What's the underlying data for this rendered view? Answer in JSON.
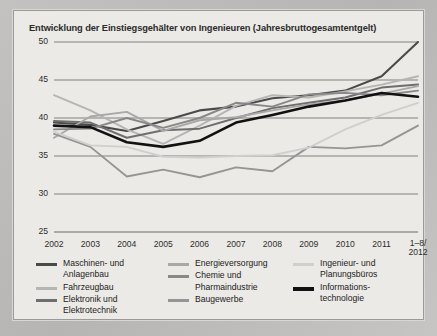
{
  "panel": {
    "background_color": "#eceae6",
    "frame_color": "#9b9a98"
  },
  "header": {
    "title": "Entwicklung der Einstiegsgehälter von Ingenieuren (Jahresbruttogesamtentgelt)"
  },
  "legend": {
    "columns": [
      {
        "items": [
          {
            "label": "Maschinen- und\nAnlagenbau",
            "color": "#4a4a4a",
            "width": 3.4
          },
          {
            "label": "Fahrzeugbau",
            "color": "#b5b5b5",
            "width": 3.0
          },
          {
            "label": "Elektronik und\nElektrotechnik",
            "color": "#6e6e6e",
            "width": 3.2
          }
        ]
      },
      {
        "items": [
          {
            "label": "Energieversorgung",
            "color": "#a8a8a8",
            "width": 3.0
          },
          {
            "label": "Chemie und\nPharmaindustrie",
            "color": "#888888",
            "width": 3.0
          },
          {
            "label": "Baugewerbe",
            "color": "#959595",
            "width": 3.0
          }
        ]
      },
      {
        "items": [
          {
            "label": "Ingenieur- und\nPlanungsbüros",
            "color": "#cfcfcf",
            "width": 3.0
          },
          {
            "label": "Informations-\ntechnologie",
            "color": "#111111",
            "width": 4.2
          }
        ]
      }
    ]
  },
  "chart_data": {
    "type": "line",
    "title": "Entwicklung der Einstiegsgehälter von Ingenieuren (Jahresbruttogesamtentgelt)",
    "xlabel": "",
    "ylabel": "",
    "ylim": [
      25,
      50
    ],
    "yticks": [
      25,
      30,
      35,
      40,
      45,
      50
    ],
    "grid": true,
    "legend_position": "bottom",
    "x": [
      "2002",
      "2003",
      "2004",
      "2005",
      "2006",
      "2007",
      "2008",
      "2009",
      "2010",
      "2011",
      "1-8/\n2012"
    ],
    "xtick_labels": [
      "2002",
      "2003",
      "2004",
      "2005",
      "2006",
      "2007",
      "2008",
      "2009",
      "2010",
      "2011",
      "1–8/\n2012"
    ],
    "series": [
      {
        "name": "Maschinen- und Anlagenbau",
        "color": "#4a4a4a",
        "width": 2.1,
        "values": [
          39.4,
          39.1,
          38.3,
          39.6,
          41.0,
          41.5,
          42.6,
          43.0,
          43.6,
          45.5,
          50.0
        ]
      },
      {
        "name": "Fahrzeugbau",
        "color": "#b5b5b5",
        "width": 1.9,
        "values": [
          43.0,
          41.0,
          38.5,
          36.6,
          39.0,
          41.6,
          43.0,
          42.7,
          43.5,
          44.4,
          45.5
        ]
      },
      {
        "name": "Elektronik und Elektrotechnik",
        "color": "#6e6e6e",
        "width": 2.0,
        "values": [
          39.6,
          39.4,
          37.4,
          38.4,
          38.6,
          40.0,
          41.3,
          42.0,
          42.7,
          44.0,
          44.4
        ]
      },
      {
        "name": "Energieversorgung",
        "color": "#a8a8a8",
        "width": 1.9,
        "values": [
          37.4,
          40.2,
          40.8,
          38.3,
          39.7,
          40.1,
          41.0,
          41.8,
          42.3,
          43.2,
          44.2
        ]
      },
      {
        "name": "Chemie und Pharmaindustrie",
        "color": "#888888",
        "width": 1.9,
        "values": [
          38.5,
          38.6,
          40.0,
          38.7,
          40.0,
          42.0,
          41.5,
          43.1,
          43.3,
          43.0,
          43.6
        ]
      },
      {
        "name": "Baugewerbe",
        "color": "#959595",
        "width": 1.9,
        "values": [
          37.9,
          36.2,
          32.3,
          33.2,
          32.2,
          33.5,
          33.0,
          36.2,
          36.0,
          36.4,
          39.0
        ]
      },
      {
        "name": "Ingenieur- und Planungsbüros",
        "color": "#cfcfcf",
        "width": 1.9,
        "values": [
          38.2,
          36.4,
          36.2,
          34.9,
          34.8,
          35.0,
          35.1,
          36.1,
          38.5,
          40.4,
          42.0
        ]
      },
      {
        "name": "Informationstechnologie",
        "color": "#111111",
        "width": 2.6,
        "values": [
          39.0,
          38.8,
          36.8,
          36.2,
          37.0,
          39.4,
          40.4,
          41.5,
          42.3,
          43.3,
          42.8
        ]
      }
    ]
  }
}
